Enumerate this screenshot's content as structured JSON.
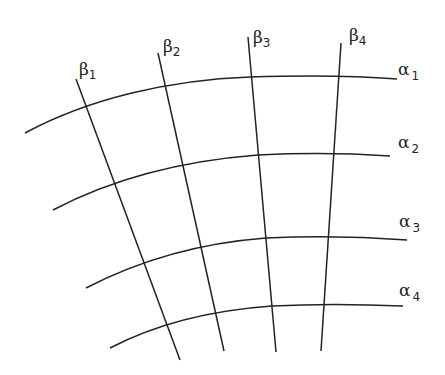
{
  "diagram": {
    "alpha_lines": [
      {
        "symbol": "α",
        "sub": "1"
      },
      {
        "symbol": "α",
        "sub": "2"
      },
      {
        "symbol": "α",
        "sub": "3"
      },
      {
        "symbol": "α",
        "sub": "4"
      }
    ],
    "beta_lines": [
      {
        "symbol": "β",
        "sub": "1"
      },
      {
        "symbol": "β",
        "sub": "2"
      },
      {
        "symbol": "β",
        "sub": "3"
      },
      {
        "symbol": "β",
        "sub": "4"
      }
    ],
    "colors": {
      "line": "#222222",
      "background": "#ffffff"
    }
  }
}
